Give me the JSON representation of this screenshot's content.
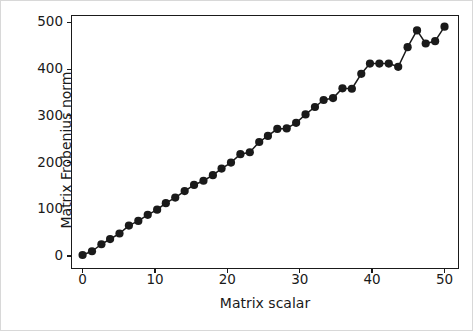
{
  "chart_data": {
    "type": "line",
    "title": "",
    "xlabel": "Matrix scalar",
    "ylabel": "Matrix Frobenius norm",
    "xlim": [
      -1.6,
      52.0
    ],
    "ylim": [
      -28,
      516
    ],
    "xticks": [
      0,
      10,
      20,
      30,
      40,
      50
    ],
    "yticks": [
      0,
      100,
      200,
      300,
      400,
      500
    ],
    "xtick_labels": [
      "0",
      "10",
      "20",
      "30",
      "40",
      "50"
    ],
    "ytick_labels": [
      "0",
      "100",
      "200",
      "300",
      "400",
      "500"
    ],
    "grid": false,
    "legend": null,
    "marker": "o",
    "marker_size": 7,
    "line_width": 1.5,
    "color": "#1a1a1a",
    "x": [
      0.0,
      1.3,
      2.6,
      3.8,
      5.1,
      6.4,
      7.7,
      9.0,
      10.3,
      11.5,
      12.8,
      14.1,
      15.4,
      16.7,
      18.0,
      19.2,
      20.5,
      21.8,
      23.1,
      24.4,
      25.6,
      26.9,
      28.2,
      29.5,
      30.8,
      32.1,
      33.3,
      34.6,
      35.9,
      37.2,
      38.5,
      39.7,
      41.0,
      42.3,
      43.6,
      44.9,
      46.2,
      47.4,
      48.7,
      50.0
    ],
    "y": [
      2,
      10,
      25,
      36,
      48,
      65,
      75,
      88,
      99,
      113,
      125,
      139,
      152,
      161,
      173,
      187,
      200,
      218,
      222,
      244,
      257,
      272,
      273,
      285,
      303,
      319,
      334,
      338,
      359,
      358,
      390,
      412,
      412,
      412,
      405,
      447,
      483,
      455,
      460,
      491
    ]
  }
}
